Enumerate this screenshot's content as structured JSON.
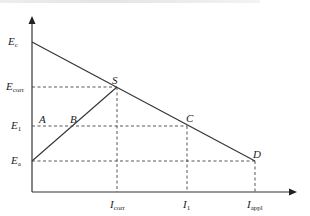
{
  "diagram": {
    "type": "polarization-schematic",
    "y_axis": {
      "labels": [
        {
          "id": "Ec",
          "main": "E",
          "sub": "c"
        },
        {
          "id": "Ecorr",
          "main": "E",
          "sub": "corr"
        },
        {
          "id": "E1",
          "main": "E",
          "sub": "1"
        },
        {
          "id": "Ea",
          "main": "E",
          "sub": "a"
        }
      ]
    },
    "x_axis": {
      "labels": [
        {
          "id": "Icorr",
          "main": "I",
          "sub": "corr"
        },
        {
          "id": "I1",
          "main": "I",
          "sub": "1"
        },
        {
          "id": "Iappl",
          "main": "I",
          "sub": "appl"
        }
      ]
    },
    "points": {
      "A": "A",
      "B": "B",
      "S": "S",
      "C": "C",
      "D": "D"
    },
    "colors": {
      "line": "#333333",
      "dashed": "#444444",
      "text": "#222222"
    }
  }
}
